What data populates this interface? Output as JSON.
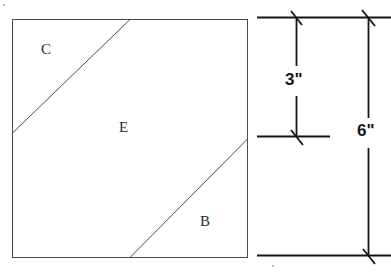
{
  "figure": {
    "background_color": "#ffffff",
    "line_color": "#3a3a3a",
    "dimension_line_color": "#151515",
    "square": {
      "name": "main-square",
      "x": 12,
      "y": 19,
      "width": 236,
      "height": 239,
      "stroke_width": 1
    },
    "diagonals": [
      {
        "name": "diagonal-upper",
        "from": {
          "x": 12,
          "y": 133
        },
        "to": {
          "x": 130,
          "y": 19
        },
        "separates": "C from E"
      },
      {
        "name": "diagonal-lower",
        "from": {
          "x": 130,
          "y": 258
        },
        "to": {
          "x": 248,
          "y": 139
        },
        "separates": "E from B"
      }
    ],
    "region_labels": [
      {
        "id": "C",
        "text": "C",
        "x": 41,
        "y": 42
      },
      {
        "id": "E",
        "text": "E",
        "x": 119,
        "y": 120
      },
      {
        "id": "B",
        "text": "B",
        "x": 200,
        "y": 214
      }
    ],
    "dimensions": [
      {
        "id": "dim-3",
        "text": "3\"",
        "label_x": 285,
        "label_y": 71,
        "extension_x": 296,
        "from_y": 17,
        "to_y": 136,
        "value": 3,
        "unit": "inches"
      },
      {
        "id": "dim-6",
        "text": "6\"",
        "label_x": 357,
        "label_y": 122,
        "extension_x": 368,
        "from_y": 17,
        "to_y": 255,
        "value": 6,
        "unit": "inches"
      }
    ],
    "tick_lines": [
      {
        "id": "tick-line-top",
        "y": 17,
        "x1": 257,
        "x2": 391
      },
      {
        "id": "tick-line-middle",
        "y": 136,
        "x1": 257,
        "x2": 330
      },
      {
        "id": "tick-line-bottom",
        "y": 255,
        "x1": 257,
        "x2": 391
      }
    ],
    "tick_marks": [
      {
        "id": "tick-top-left",
        "x": 296,
        "y": 17
      },
      {
        "id": "tick-top-right",
        "x": 368,
        "y": 17
      },
      {
        "id": "tick-middle-left",
        "x": 296,
        "y": 136
      },
      {
        "id": "tick-bottom-right",
        "x": 368,
        "y": 255
      }
    ]
  }
}
